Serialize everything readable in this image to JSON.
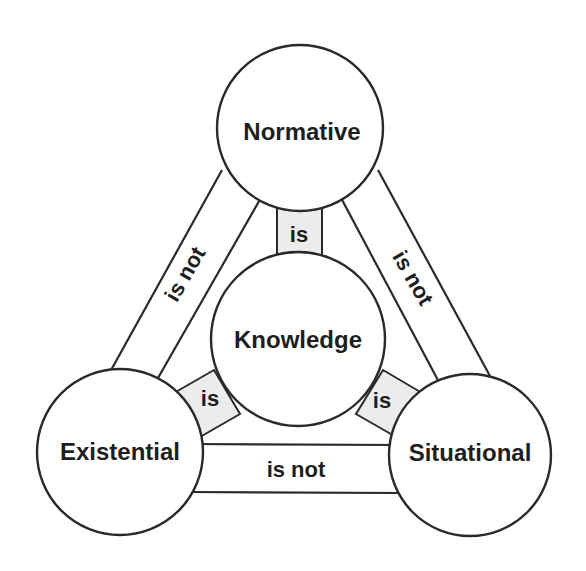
{
  "diagram": {
    "nodes": {
      "normative": {
        "label": "Normative"
      },
      "knowledge": {
        "label": "Knowledge"
      },
      "existential": {
        "label": "Existential"
      },
      "situational": {
        "label": "Situational"
      }
    },
    "edges": {
      "normative_knowledge": {
        "label": "is",
        "relation": "Normative – Knowledge"
      },
      "existential_knowledge": {
        "label": "is",
        "relation": "Existential – Knowledge"
      },
      "situational_knowledge": {
        "label": "is",
        "relation": "Situational – Knowledge"
      },
      "normative_existential": {
        "label": "is not",
        "relation": "Normative – Existential"
      },
      "normative_situational": {
        "label": "is not",
        "relation": "Normative – Situational"
      },
      "existential_situational": {
        "label": "is not",
        "relation": "Existential – Situational"
      }
    },
    "colors": {
      "stroke": "#2a2a2a",
      "connector_fill": "#ececec",
      "background": "#ffffff"
    }
  }
}
